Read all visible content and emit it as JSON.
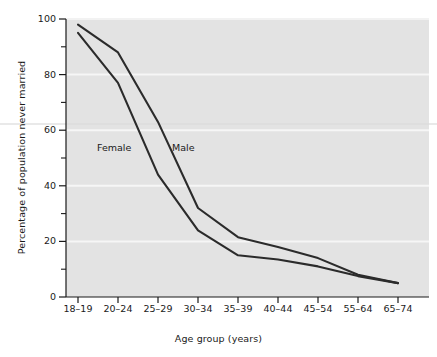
{
  "chart_data": {
    "type": "line",
    "title": "",
    "xlabel": "Age group (years)",
    "ylabel": "Percentage of population never married",
    "categories": [
      "18–19",
      "20–24",
      "25–29",
      "30–34",
      "35–39",
      "40–44",
      "45–54",
      "55–64",
      "65–74"
    ],
    "ylim": [
      0,
      100
    ],
    "yticks": [
      0,
      20,
      40,
      60,
      80,
      100
    ],
    "ytick_labels": [
      "0",
      "20",
      "40",
      "60",
      "80",
      "100"
    ],
    "yminorticks": [
      10,
      30,
      50,
      70,
      90
    ],
    "grid": "horizontal-white-major",
    "legend": "inline-annotations",
    "series": [
      {
        "name": "Male",
        "label": "Male",
        "color": "#2b2b2b",
        "values": [
          98,
          88,
          63,
          32,
          21.5,
          18,
          14,
          8,
          5
        ]
      },
      {
        "name": "Female",
        "label": "Female",
        "color": "#2b2b2b",
        "values": [
          95,
          77,
          44,
          24,
          15,
          13.5,
          11,
          7.5,
          5
        ]
      }
    ],
    "annotations": [
      {
        "text": "Female",
        "x_category": "25–29",
        "value": 57
      },
      {
        "text": "Male",
        "x_category": "30–34",
        "value": 57
      }
    ],
    "colors": {
      "plot_background": "#e3e3e3",
      "page_background": "#ffffff",
      "gridline": "#f4f4f4",
      "axis": "#1a1a1a",
      "line": "#2b2b2b",
      "text": "#1a1a1a"
    }
  }
}
